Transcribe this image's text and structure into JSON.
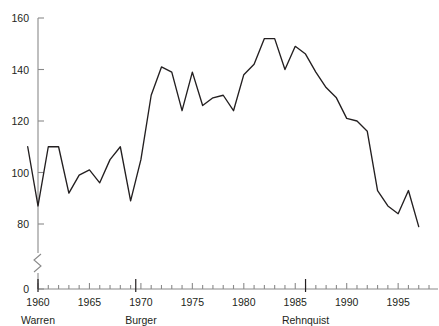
{
  "figure": {
    "title_partial": "Number of cases, per Term",
    "background": "#ffffff",
    "line_color": "#231f20",
    "axis_color": "#8a8a8a",
    "text_color": "#231f20"
  },
  "yaxis": {
    "labels": [
      "160",
      "140",
      "120",
      "100",
      "80",
      "0"
    ],
    "values": [
      160,
      140,
      120,
      100,
      80,
      0
    ],
    "has_break": true,
    "break_symbol": "axis-break-zigzag"
  },
  "xaxis": {
    "major_labels": [
      "1960",
      "1965",
      "1970",
      "1975",
      "1980",
      "1985",
      "1990",
      "1995"
    ],
    "major_values": [
      1960,
      1965,
      1970,
      1975,
      1980,
      1985,
      1990,
      1995
    ],
    "minor_tick_interval": 1,
    "range": [
      1959,
      1998
    ]
  },
  "eras": [
    {
      "name": "Warren",
      "marker_year": 1960,
      "label_x": 1960
    },
    {
      "name": "Burger",
      "marker_year": 1969.5,
      "label_x": 1970
    },
    {
      "name": "Rehnquist",
      "marker_year": 1986,
      "label_x": 1986
    }
  ],
  "chart_data": {
    "type": "line",
    "title": "Number of cases, per Term",
    "xlabel": "",
    "ylabel": "",
    "xlim": [
      1959,
      1998
    ],
    "ylim": [
      73,
      160
    ],
    "grid": false,
    "legend": "none",
    "x": [
      1959,
      1960,
      1961,
      1962,
      1963,
      1964,
      1965,
      1966,
      1967,
      1968,
      1969,
      1970,
      1971,
      1972,
      1973,
      1974,
      1975,
      1976,
      1977,
      1978,
      1979,
      1980,
      1981,
      1982,
      1983,
      1984,
      1985,
      1986,
      1987,
      1988,
      1989,
      1990,
      1991,
      1992,
      1993,
      1994,
      1995,
      1996,
      1997
    ],
    "series": [
      {
        "name": "Cases decided",
        "values": [
          110,
          87,
          110,
          110,
          92,
          99,
          101,
          96,
          105,
          110,
          89,
          105,
          130,
          141,
          139,
          124,
          139,
          126,
          129,
          130,
          124,
          138,
          142,
          152,
          152,
          140,
          149,
          146,
          139,
          133,
          129,
          121,
          120,
          116,
          93,
          87,
          84,
          93,
          79
        ]
      }
    ]
  }
}
